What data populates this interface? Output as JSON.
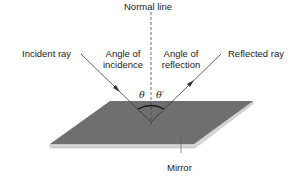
{
  "diagram": {
    "labels": {
      "normal_line": "Normal line",
      "incident_ray": "Incident ray",
      "reflected_ray": "Reflected ray",
      "angle_incidence_line1": "Angle of",
      "angle_incidence_line2": "incidence",
      "angle_reflection_line1": "Angle of",
      "angle_reflection_line2": "reflection",
      "theta": "θ",
      "theta_prime": "θ′",
      "mirror": "Mirror"
    },
    "colors": {
      "mirror_surface": "#6f6f6f",
      "mirror_edge": "#d4d4d4",
      "rays": "#333333",
      "normal_line": "#444444",
      "text": "#222222"
    }
  }
}
